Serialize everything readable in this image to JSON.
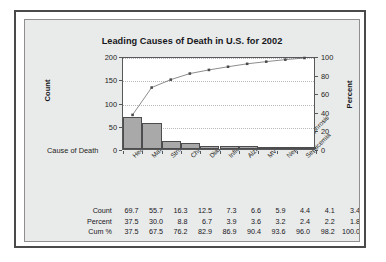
{
  "frame": {
    "border_color": "#4a4a4a",
    "panel_color": "#e9eaea"
  },
  "chart_data": {
    "type": "bar",
    "title": "Leading Causes of Death in U.S. for 2002",
    "xlabel": "Cause of Death",
    "ylabel": "Count",
    "y2label": "Percent",
    "ylim": [
      0,
      200
    ],
    "y2lim": [
      0,
      100
    ],
    "yticks": [
      "0",
      "50",
      "100",
      "150",
      "200"
    ],
    "y2ticks": [
      "0",
      "20",
      "40",
      "60",
      "80",
      "100"
    ],
    "grid": true,
    "legend": "none",
    "categories": [
      "Heart Disease",
      "Malignant Neoplasms",
      "Stroke",
      "Chronic Resp. Dis.",
      "Diabetes",
      "Influenza/Pneumonia",
      "Alzheimer's",
      "MV Traffic Crashes",
      "Nephritis/Nephrosis",
      "Septicemia"
    ],
    "series": [
      {
        "name": "Count",
        "type": "bar",
        "values": [
          69.7,
          55.7,
          16.3,
          12.5,
          7.3,
          6.6,
          5.9,
          4.4,
          4.1,
          3.4
        ]
      },
      {
        "name": "Percent",
        "type": "values",
        "values": [
          37.5,
          30.0,
          8.8,
          6.7,
          3.9,
          3.6,
          3.2,
          2.4,
          2.2,
          1.8
        ]
      },
      {
        "name": "Cum %",
        "type": "line",
        "values": [
          37.5,
          67.5,
          76.2,
          82.9,
          86.9,
          90.4,
          93.6,
          96.0,
          98.2,
          100.0
        ]
      }
    ],
    "bar_fill_color": "#a9a9a9",
    "bar_edge_color": "#4d4d4f",
    "line_color": "#6e6e70",
    "marker_color": "#4a4a4c"
  },
  "table": {
    "rows": [
      {
        "label": "Count",
        "values": [
          "69.7",
          "55.7",
          "16.3",
          "12.5",
          "7.3",
          "6.6",
          "5.9",
          "4.4",
          "4.1",
          "3.4"
        ]
      },
      {
        "label": "Percent",
        "values": [
          "37.5",
          "30.0",
          "8.8",
          "6.7",
          "3.9",
          "3.6",
          "3.2",
          "2.4",
          "2.2",
          "1.8"
        ]
      },
      {
        "label": "Cum %",
        "values": [
          "37.5",
          "67.5",
          "76.2",
          "82.9",
          "86.9",
          "90.4",
          "93.6",
          "96.0",
          "98.2",
          "100.0"
        ]
      }
    ]
  }
}
